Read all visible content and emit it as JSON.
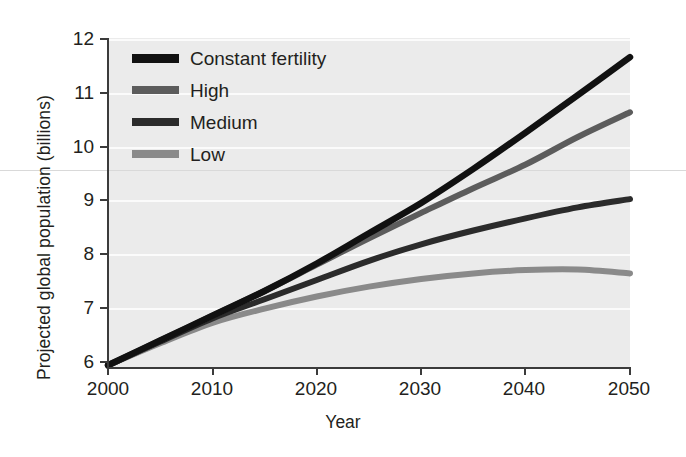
{
  "chart_data": {
    "type": "line",
    "title": "",
    "xlabel": "Year",
    "ylabel": "Projected global population (billions)",
    "xlim": [
      2000,
      2050
    ],
    "ylim": [
      6,
      12
    ],
    "xticks": [
      "2000",
      "2010",
      "2020",
      "2030",
      "2040",
      "2050"
    ],
    "yticks": [
      "6",
      "7",
      "8",
      "9",
      "10",
      "11",
      "12"
    ],
    "grid": "horizontal",
    "legend_position": "top-left-inside",
    "x": [
      2000,
      2005,
      2010,
      2015,
      2020,
      2025,
      2030,
      2035,
      2040,
      2045,
      2050
    ],
    "series": [
      {
        "name": "Constant fertility",
        "color": "#111111",
        "values": [
          6.05,
          6.5,
          6.95,
          7.4,
          7.9,
          8.45,
          9.0,
          9.62,
          10.28,
          10.96,
          11.65
        ]
      },
      {
        "name": "High",
        "color": "#5c5c5c",
        "values": [
          6.05,
          6.5,
          6.95,
          7.4,
          7.88,
          8.36,
          8.82,
          9.27,
          9.7,
          10.2,
          10.65
        ]
      },
      {
        "name": "Medium",
        "color": "#2b2b2b",
        "values": [
          6.05,
          6.48,
          6.9,
          7.25,
          7.6,
          7.95,
          8.25,
          8.5,
          8.72,
          8.92,
          9.07
        ]
      },
      {
        "name": "Low",
        "color": "#8a8a8a",
        "values": [
          6.05,
          6.45,
          6.82,
          7.08,
          7.3,
          7.48,
          7.62,
          7.72,
          7.78,
          7.79,
          7.72
        ]
      }
    ]
  },
  "axes": {
    "y_title": "Projected global population (billions)",
    "x_title": "Year",
    "y_tick_labels": [
      "12",
      "11",
      "10",
      "9",
      "8",
      "7",
      "6"
    ],
    "x_tick_labels": [
      "2000",
      "2010",
      "2020",
      "2030",
      "2040",
      "2050"
    ]
  },
  "legend": {
    "items": [
      {
        "label": "Constant fertility",
        "color": "#111111"
      },
      {
        "label": "High",
        "color": "#5c5c5c"
      },
      {
        "label": "Medium",
        "color": "#2b2b2b"
      },
      {
        "label": "Low",
        "color": "#8a8a8a"
      }
    ]
  },
  "colors": {
    "plot_background": "#ebebeb",
    "gridline": "#fbfbfb",
    "axis": "#3b3b3b",
    "text": "#231f20",
    "page_background": "#ffffff"
  }
}
